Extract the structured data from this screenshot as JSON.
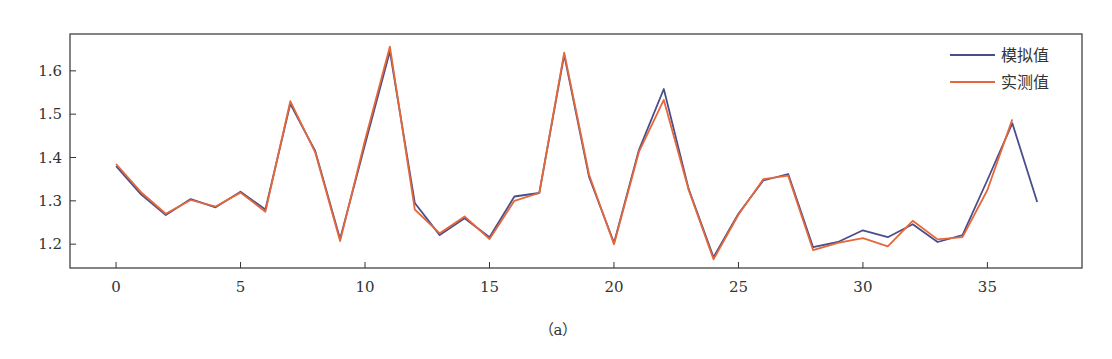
{
  "chart_data": {
    "type": "line",
    "title": "",
    "xlabel": "",
    "ylabel": "",
    "xlim": [
      -1.85,
      38.8
    ],
    "ylim": [
      1.145,
      1.685
    ],
    "xticks": [
      0,
      5,
      10,
      15,
      20,
      25,
      30,
      35
    ],
    "yticks": [
      1.2,
      1.3,
      1.4,
      1.5,
      1.6
    ],
    "ytick_labels": [
      "1.2",
      "1.3",
      "1.4",
      "1.5",
      "1.6"
    ],
    "grid": false,
    "legend_position": "upper right",
    "series": [
      {
        "name": "模拟值",
        "color": "#4a4e8a",
        "x": [
          0,
          1,
          2,
          3,
          4,
          5,
          6,
          7,
          8,
          9,
          10,
          11,
          12,
          13,
          14,
          15,
          16,
          17,
          18,
          19,
          20,
          21,
          22,
          23,
          24,
          25,
          26,
          27,
          28,
          29,
          30,
          31,
          32,
          33,
          34,
          35,
          36,
          37
        ],
        "values": [
          1.38,
          1.315,
          1.267,
          1.304,
          1.285,
          1.321,
          1.28,
          1.524,
          1.415,
          1.212,
          1.43,
          1.645,
          1.295,
          1.221,
          1.26,
          1.216,
          1.31,
          1.318,
          1.637,
          1.355,
          1.203,
          1.417,
          1.558,
          1.327,
          1.17,
          1.27,
          1.347,
          1.362,
          1.193,
          1.205,
          1.232,
          1.216,
          1.246,
          1.205,
          1.221,
          1.348,
          1.479,
          1.297
        ]
      },
      {
        "name": "实测值",
        "color": "#e6683a",
        "x": [
          0,
          1,
          2,
          3,
          4,
          5,
          6,
          7,
          8,
          9,
          10,
          11,
          12,
          13,
          14,
          15,
          16,
          17,
          18,
          19,
          20,
          21,
          22,
          23,
          24,
          25,
          26,
          27,
          28,
          29,
          30,
          31,
          32,
          33,
          34,
          35,
          36
        ],
        "values": [
          1.385,
          1.32,
          1.27,
          1.302,
          1.287,
          1.319,
          1.275,
          1.53,
          1.412,
          1.207,
          1.44,
          1.656,
          1.28,
          1.225,
          1.264,
          1.212,
          1.3,
          1.318,
          1.642,
          1.36,
          1.2,
          1.413,
          1.533,
          1.325,
          1.165,
          1.268,
          1.35,
          1.358,
          1.186,
          1.203,
          1.214,
          1.195,
          1.254,
          1.211,
          1.216,
          1.325,
          1.488
        ]
      }
    ]
  },
  "legend": {
    "items": [
      {
        "label": "模拟值",
        "color": "#4a4e8a"
      },
      {
        "label": "实测值",
        "color": "#e6683a"
      }
    ]
  },
  "caption": "（a）"
}
